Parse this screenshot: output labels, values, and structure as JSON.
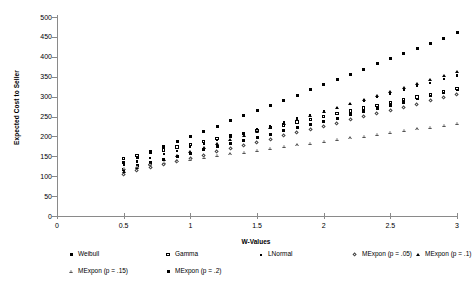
{
  "chart_data": {
    "type": "scatter",
    "title": "",
    "xlabel": "W-Values",
    "ylabel": "Expected Cost to Seller",
    "xlim": [
      0,
      3
    ],
    "ylim": [
      0,
      500
    ],
    "xticks": [
      "0",
      "0.5",
      "1",
      "1.5",
      "2",
      "2.5",
      "3"
    ],
    "yticks": [
      "0",
      "50",
      "100",
      "150",
      "200",
      "250",
      "300",
      "350",
      "400",
      "450",
      "500"
    ],
    "grid": false,
    "legend_position": "bottom",
    "x": [
      0.5,
      0.6,
      0.7,
      0.8,
      0.9,
      1.0,
      1.1,
      1.2,
      1.3,
      1.4,
      1.5,
      1.6,
      1.7,
      1.8,
      1.9,
      2.0,
      2.1,
      2.2,
      2.3,
      2.4,
      2.5,
      2.6,
      2.7,
      2.8,
      2.9,
      3.0
    ],
    "series": [
      {
        "name": "Weibull",
        "marker": "filled-square",
        "values": [
          118,
          126,
          134,
          142,
          150,
          158,
          166,
          174,
          182,
          190,
          198,
          206,
          214,
          222,
          230,
          238,
          246,
          254,
          262,
          270,
          278,
          286,
          294,
          302,
          310,
          318
        ]
      },
      {
        "name": "Gamma",
        "marker": "open-square",
        "values": [
          145,
          152,
          159,
          166,
          173,
          180,
          187,
          194,
          201,
          208,
          215,
          222,
          229,
          236,
          243,
          250,
          257,
          264,
          271,
          278,
          285,
          292,
          299,
          306,
          313,
          320
        ]
      },
      {
        "name": "LNormal",
        "marker": "small-filled-square",
        "values": [
          128,
          137,
          146,
          155,
          164,
          173,
          182,
          191,
          200,
          209,
          218,
          227,
          236,
          245,
          254,
          263,
          272,
          281,
          290,
          299,
          308,
          317,
          326,
          335,
          344,
          353
        ]
      },
      {
        "name": "MExpon (p = .05)",
        "marker": "open-diamond",
        "values": [
          105,
          113,
          121,
          129,
          137,
          145,
          153,
          161,
          169,
          177,
          185,
          193,
          201,
          209,
          217,
          225,
          233,
          241,
          249,
          257,
          265,
          273,
          281,
          289,
          297,
          305
        ]
      },
      {
        "name": "MExpon (p = .1)",
        "marker": "filled-triangle",
        "values": [
          112,
          122,
          132,
          142,
          152,
          162,
          172,
          182,
          192,
          202,
          212,
          222,
          232,
          242,
          252,
          262,
          272,
          282,
          292,
          302,
          312,
          322,
          332,
          342,
          352,
          362
        ]
      },
      {
        "name": "MExpon (p = .15)",
        "marker": "open-triangle",
        "values": [
          120,
          132,
          144,
          156,
          168,
          180,
          192,
          204,
          216,
          228,
          240,
          252,
          264,
          276,
          288,
          300,
          312,
          324,
          336,
          348,
          360,
          372,
          384,
          396,
          408,
          420
        ]
      },
      {
        "name": "MExpon (p = .2)",
        "marker": "filled-square",
        "values": [
          135,
          148,
          161,
          174,
          187,
          200,
          213,
          226,
          239,
          252,
          265,
          278,
          291,
          304,
          317,
          330,
          343,
          356,
          369,
          382,
          395,
          408,
          421,
          434,
          447,
          460
        ]
      }
    ]
  },
  "legend": {
    "row1": [
      "Weibull",
      "Gamma",
      "LNormal",
      "MExpon (p = .05)",
      "MExpon (p = .1)"
    ],
    "row2": [
      "MExpon (p = .15)",
      "MExpon (p = .2)"
    ]
  }
}
